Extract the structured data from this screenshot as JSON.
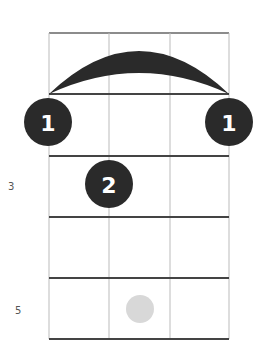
{
  "diagram": {
    "type": "ukulele-chord-diagram",
    "strings": 4,
    "frets_shown": 5,
    "colors": {
      "line": "#444444",
      "thin_line": "#bbbbbb",
      "finger": "#2a2a2a",
      "finger_text": "#ffffff",
      "ghost": "#d8d8d8",
      "label": "#555555"
    },
    "fret_labels": [
      {
        "fret": 3,
        "text": "3"
      },
      {
        "fret": 5,
        "text": "5"
      }
    ],
    "barre": {
      "fret": 1,
      "from_string": 1,
      "to_string": 4,
      "finger": "1"
    },
    "fingers": [
      {
        "string": 1,
        "fret": 1,
        "label": "1"
      },
      {
        "string": 4,
        "fret": 1,
        "label": "1"
      },
      {
        "string": 2,
        "fret": 2,
        "label": "2"
      }
    ],
    "ghost_notes": [
      {
        "string": 2,
        "fret": 5
      }
    ]
  }
}
